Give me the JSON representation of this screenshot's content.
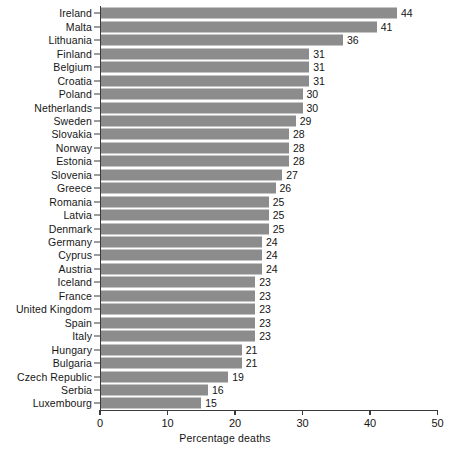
{
  "chart_data": {
    "type": "bar",
    "orientation": "horizontal",
    "title": "",
    "xlabel": "Percentage deaths",
    "ylabel": "",
    "xlim": [
      0,
      50
    ],
    "xticks": [
      0,
      10,
      20,
      30,
      40,
      50
    ],
    "grid": false,
    "legend": null,
    "bar_color": "#8c8c8c",
    "axis_color": "#3a3a3a",
    "categories": [
      "Ireland",
      "Malta",
      "Lithuania",
      "Finland",
      "Belgium",
      "Croatia",
      "Poland",
      "Netherlands",
      "Sweden",
      "Slovakia",
      "Norway",
      "Estonia",
      "Slovenia",
      "Greece",
      "Romania",
      "Latvia",
      "Denmark",
      "Germany",
      "Cyprus",
      "Austria",
      "Iceland",
      "France",
      "United Kingdom",
      "Spain",
      "Italy",
      "Hungary",
      "Bulgaria",
      "Czech Republic",
      "Serbia",
      "Luxembourg"
    ],
    "values": [
      44,
      41,
      36,
      31,
      31,
      31,
      30,
      30,
      29,
      28,
      28,
      28,
      27,
      26,
      25,
      25,
      25,
      24,
      24,
      24,
      23,
      23,
      23,
      23,
      23,
      21,
      21,
      19,
      16,
      15
    ],
    "data_labels": [
      "44",
      "41",
      "36",
      "31",
      "31",
      "31",
      "30",
      "30",
      "29",
      "28",
      "28",
      "28",
      "27",
      "26",
      "25",
      "25",
      "25",
      "24",
      "24",
      "24",
      "23",
      "23",
      "23",
      "23",
      "23",
      "21",
      "21",
      "19",
      "16",
      "15"
    ]
  }
}
